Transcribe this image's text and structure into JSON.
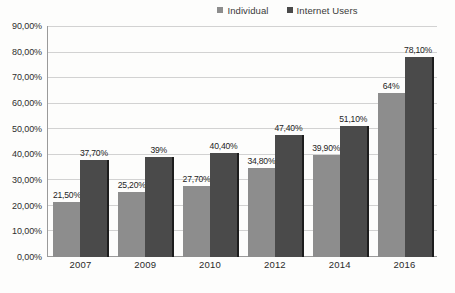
{
  "chart_data": {
    "type": "bar",
    "title": "",
    "xlabel": "",
    "ylabel": "",
    "categories": [
      "2007",
      "2009",
      "2010",
      "2012",
      "2014",
      "2016"
    ],
    "series": [
      {
        "name": "Individual",
        "color": "#8d8d8d",
        "values": [
          21.5,
          25.2,
          27.7,
          34.8,
          39.9,
          64
        ],
        "labels": [
          "21,50%",
          "25,20%",
          "27,70%",
          "34,80%",
          "39,90%",
          "64%"
        ]
      },
      {
        "name": "Internet Users",
        "color": "#4a4a4a",
        "values": [
          37.7,
          39,
          40.4,
          47.4,
          51.1,
          78.1
        ],
        "labels": [
          "37,70%",
          "39%",
          "40,40%",
          "47,40%",
          "51,10%",
          "78,10%"
        ]
      }
    ],
    "ylim": [
      0,
      90
    ],
    "yticks": [
      0,
      10,
      20,
      30,
      40,
      50,
      60,
      70,
      80,
      90
    ],
    "ytick_labels": [
      "0,00%",
      "10,00%",
      "20,00%",
      "30,00%",
      "40,00%",
      "50,00%",
      "60,00%",
      "70,00%",
      "80,00%",
      "90,00%"
    ],
    "grid": true,
    "legend_position": "top-right"
  }
}
